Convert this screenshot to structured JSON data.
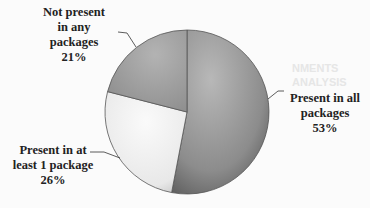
{
  "chart_data": {
    "type": "pie",
    "title": "",
    "categories": [
      "Present in all packages",
      "Present in at least 1 package",
      "Not present in any packages"
    ],
    "values": [
      53,
      26,
      21
    ],
    "unit": "%",
    "colors": [
      "#8f8f8f",
      "#ececec",
      "#a5a5a5"
    ],
    "start_angle_deg": 0,
    "direction": "clockwise",
    "legend": "none",
    "data_labels": [
      {
        "line1": "Present in all",
        "line2": "packages",
        "pct": "53%"
      },
      {
        "line1": "Present in at",
        "line2": "least 1 package",
        "pct": "26%"
      },
      {
        "line1": "Not present",
        "line2": "in any",
        "line3": "packages",
        "pct": "21%"
      }
    ]
  }
}
